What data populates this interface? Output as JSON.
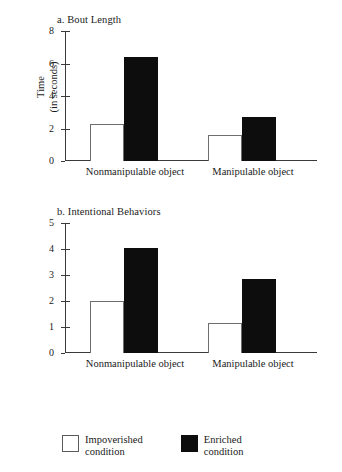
{
  "figure": {
    "background": "#ffffff",
    "ink": "#1a1a1a"
  },
  "legend": {
    "position": "bottom-left",
    "items": [
      {
        "swatch": "open",
        "line1": "Impoverished",
        "line2": "condition",
        "color": "#ffffff"
      },
      {
        "swatch": "filled",
        "line1": "Enriched",
        "line2": "condition",
        "color": "#0d0d0d"
      }
    ]
  },
  "chart_data": [
    {
      "type": "bar",
      "id": "panel-a",
      "title": "a. Bout Length",
      "categories": [
        "Nonmanipulable object",
        "Manipulable object"
      ],
      "category_lines": [
        [
          "Nonmanipulable",
          "object"
        ],
        [
          "Manipulable",
          "object"
        ]
      ],
      "series": [
        {
          "name": "Impoverished condition",
          "values": [
            2.3,
            1.6
          ],
          "color": "#ffffff"
        },
        {
          "name": "Enriched condition",
          "values": [
            6.4,
            2.7
          ],
          "color": "#0d0d0d"
        }
      ],
      "xlabel": "",
      "ylabel": "Time (in seconds)",
      "ylabel_lines": [
        "Time",
        "(in seconds)"
      ],
      "ylim": [
        0,
        8
      ],
      "yticks": [
        0,
        2,
        4,
        6,
        8
      ],
      "ytick_labels": [
        "0",
        "2",
        "4",
        "6",
        "8"
      ],
      "grid": false
    },
    {
      "type": "bar",
      "id": "panel-b",
      "title": "b. Intentional Behaviors",
      "categories": [
        "Nonmanipulable object",
        "Manipulable object"
      ],
      "category_lines": [
        [
          "Nonmanipulable",
          "object"
        ],
        [
          "Manipulable",
          "object"
        ]
      ],
      "series": [
        {
          "name": "Impoverished condition",
          "values": [
            2.0,
            1.15
          ],
          "color": "#ffffff"
        },
        {
          "name": "Enriched condition",
          "values": [
            4.05,
            2.83
          ],
          "color": "#0d0d0d"
        }
      ],
      "xlabel": "",
      "ylabel": "",
      "ylim": [
        0,
        5
      ],
      "yticks": [
        0,
        1,
        2,
        3,
        4,
        5
      ],
      "ytick_labels": [
        "0",
        "1",
        "2",
        "3",
        "4",
        "5"
      ],
      "grid": false
    }
  ]
}
